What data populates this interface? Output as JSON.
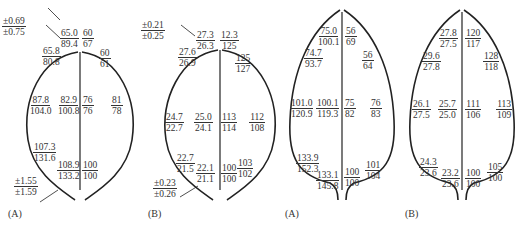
{
  "panels": [
    {
      "label": "(A)",
      "error_top": {
        "num": "±0.69",
        "den": "±0.75"
      },
      "error_bottom": {
        "num": "±1.55",
        "den": "±1.59"
      },
      "cells": [
        {
          "num": "65.0",
          "den": "89.4"
        },
        {
          "num": "60",
          "den": "67"
        },
        {
          "num": "65.8",
          "den": "80.8"
        },
        {
          "num": "60",
          "den": "61"
        },
        {
          "num": "87.8",
          "den": "104.0"
        },
        {
          "num": "82.9",
          "den": "100.8"
        },
        {
          "num": "76",
          "den": "76"
        },
        {
          "num": "81",
          "den": "78"
        },
        {
          "num": "107.3",
          "den": "131.6"
        },
        {
          "num": "108.9",
          "den": "133.2"
        },
        {
          "num": "100",
          "den": "100"
        }
      ]
    },
    {
      "label": "(B)",
      "error_top": {
        "num": "±0.21",
        "den": "±0.25"
      },
      "error_bottom": {
        "num": "±0.23",
        "den": "±0.26"
      },
      "cells": [
        {
          "num": "27.3",
          "den": "26.3"
        },
        {
          "num": "12.3",
          "den": "125"
        },
        {
          "num": "27.6",
          "den": "26.9"
        },
        {
          "num": "125",
          "den": "127"
        },
        {
          "num": "24.7",
          "den": "22.7"
        },
        {
          "num": "25.0",
          "den": "24.1"
        },
        {
          "num": "113",
          "den": "114"
        },
        {
          "num": "112",
          "den": "108"
        },
        {
          "num": "22.7",
          "den": "21.5"
        },
        {
          "num": "22.1",
          "den": "21.1"
        },
        {
          "num": "100",
          "den": "100"
        },
        {
          "num": "103",
          "den": "102"
        }
      ]
    },
    {
      "label": "(A)",
      "cells": [
        {
          "num": "75.0",
          "den": "100.1"
        },
        {
          "num": "56",
          "den": "69"
        },
        {
          "num": "74.7",
          "den": "93.7"
        },
        {
          "num": "56",
          "den": "64"
        },
        {
          "num": "101.0",
          "den": "120.9"
        },
        {
          "num": "100.1",
          "den": "119.3"
        },
        {
          "num": "75",
          "den": "82"
        },
        {
          "num": "76",
          "den": "83"
        },
        {
          "num": "133.9",
          "den": "152.3"
        },
        {
          "num": "133.1",
          "den": "145.8"
        },
        {
          "num": "100",
          "den": "100"
        },
        {
          "num": "101",
          "den": "104"
        }
      ]
    },
    {
      "label": "(B)",
      "cells": [
        {
          "num": "27.8",
          "den": "27.5"
        },
        {
          "num": "120",
          "den": "117"
        },
        {
          "num": "29.6",
          "den": "27.8"
        },
        {
          "num": "128",
          "den": "118"
        },
        {
          "num": "26.1",
          "den": "27.5"
        },
        {
          "num": "25.7",
          "den": "25.0"
        },
        {
          "num": "111",
          "den": "106"
        },
        {
          "num": "113",
          "den": "109"
        },
        {
          "num": "24.3",
          "den": "23.6"
        },
        {
          "num": "23.2",
          "den": "23.6"
        },
        {
          "num": "100",
          "den": "100"
        },
        {
          "num": "105",
          "den": "100"
        }
      ]
    }
  ]
}
